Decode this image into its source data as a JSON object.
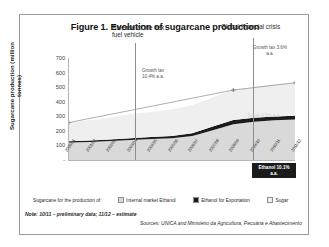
{
  "figure": {
    "title": "Figure 1. Evolution of sugarcane production",
    "note": "Note: 10/11 – preliminary data; 11/12 – estimate",
    "sources": "Sources: UNICA and Ministério da Agricultura, Pecuária e Abastecimento"
  },
  "legend": {
    "caption": "Sugarcane for the production of:",
    "entries": [
      {
        "label": "Internal market Ethanol",
        "color": "#d9d9d9"
      },
      {
        "label": "Ethanol for Exportation",
        "color": "#1b1b1b"
      },
      {
        "label": "Sugar",
        "color": "#efefef"
      }
    ]
  },
  "annotations": {
    "event_flex": "Release of the flex fuel vehicle",
    "event_crisis": "Global financial crisis",
    "growth_left": "Growth tax 10.4% a.a.",
    "growth_right": "Growth tax 3.6% a.a.",
    "ethanol_callout": "Ethanol 10.1% a.a.",
    "sugar_watermark": "Sugar 4.5% a.a."
  },
  "chart_data": {
    "type": "area",
    "title": "Figure 1. Evolution of sugarcane production",
    "xlabel": "",
    "ylabel": "Sugarcane production (million tonnes)",
    "ylim": [
      0,
      700
    ],
    "yticks": [
      0,
      100,
      200,
      300,
      400,
      500,
      600,
      700
    ],
    "grid": false,
    "legend_position": "bottom",
    "stacked": true,
    "categories": [
      "2000/01",
      "2001/02",
      "2002/03",
      "2003/04",
      "2004/05",
      "2005/06",
      "2006/07",
      "2007/08",
      "2008/09",
      "2009/10",
      "2010/11",
      "2011/12"
    ],
    "series": [
      {
        "name": "Internal market Ethanol",
        "color": "#d9d9d9",
        "values": [
          120,
          124,
          130,
          138,
          144,
          150,
          165,
          205,
          245,
          262,
          272,
          278
        ]
      },
      {
        "name": "Ethanol for Exportation",
        "color": "#1b1b1b",
        "values": [
          8,
          9,
          10,
          12,
          13,
          14,
          18,
          25,
          30,
          28,
          26,
          25
        ]
      },
      {
        "name": "Sugar",
        "color": "#efefef",
        "values": [
          129,
          140,
          152,
          166,
          172,
          182,
          192,
          200,
          205,
          213,
          222,
          227
        ]
      }
    ],
    "totals": [
      257,
      273,
      292,
      316,
      329,
      346,
      375,
      430,
      480,
      503,
      520,
      530
    ],
    "trend_lines": [
      {
        "name": "Growth tax 10.4% a.a.",
        "from": "2000/01",
        "to": "2008/09",
        "rate_pct": 10.4
      },
      {
        "name": "Growth tax 3.6% a.a.",
        "from": "2008/09",
        "to": "2011/12",
        "rate_pct": 3.6
      }
    ],
    "event_markers": [
      {
        "label": "Release of the flex fuel vehicle",
        "at": "2003/04"
      },
      {
        "label": "Global financial crisis",
        "at": "2008/09"
      }
    ]
  }
}
